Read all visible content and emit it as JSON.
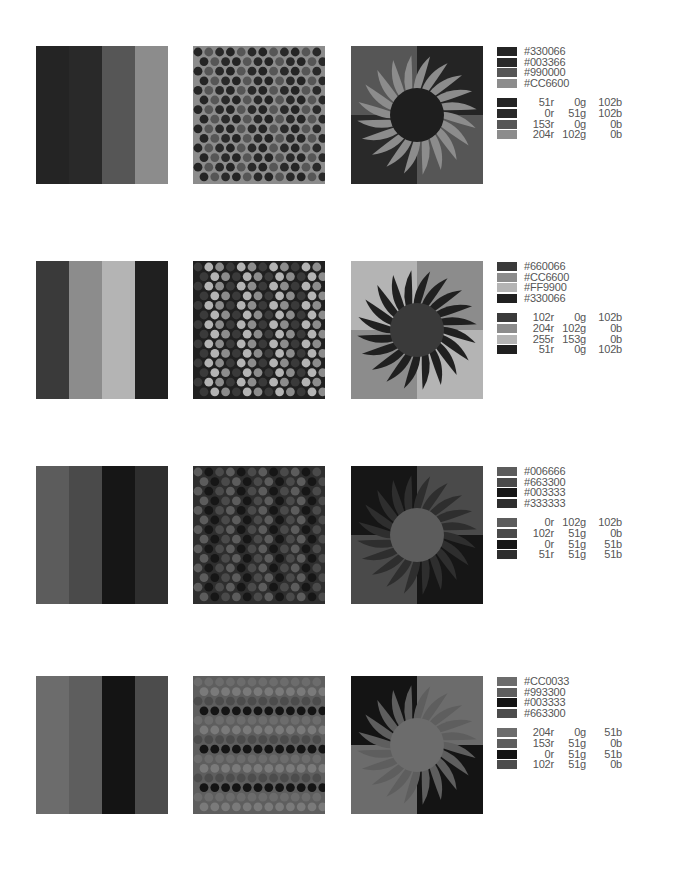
{
  "palettes": [
    {
      "id": "palette-1",
      "stripes": [
        {
          "hex": "#330066",
          "gray": "#242424",
          "width": 33
        },
        {
          "hex": "#003366",
          "gray": "#292929",
          "width": 33
        },
        {
          "hex": "#990000",
          "gray": "#565656",
          "width": 33
        },
        {
          "hex": "#CC6600",
          "gray": "#8c8c8c",
          "width": 33
        }
      ],
      "dots": {
        "bg": "#8c8c8c",
        "colors": [
          "#242424",
          "#292929",
          "#565656"
        ]
      },
      "sun": {
        "quads": [
          "#565656",
          "#242424",
          "#292929",
          "#565656"
        ],
        "rays": "#8c8c8c",
        "disc": "#1e1e1e"
      },
      "hex_labels": [
        "#330066",
        "#003366",
        "#990000",
        "#CC6600"
      ],
      "rgb_labels": [
        {
          "r": "51r",
          "g": "0g",
          "b": "102b"
        },
        {
          "r": "0r",
          "g": "51g",
          "b": "102b"
        },
        {
          "r": "153r",
          "g": "0g",
          "b": "0b"
        },
        {
          "r": "204r",
          "g": "102g",
          "b": "0b"
        }
      ],
      "swatches": [
        "#242424",
        "#292929",
        "#565656",
        "#8c8c8c"
      ]
    },
    {
      "id": "palette-2",
      "stripes": [
        {
          "hex": "#660066",
          "gray": "#3a3a3a",
          "width": 33
        },
        {
          "hex": "#CC6600",
          "gray": "#8c8c8c",
          "width": 33
        },
        {
          "hex": "#FF9900",
          "gray": "#b4b4b4",
          "width": 33
        },
        {
          "hex": "#330066",
          "gray": "#202020",
          "width": 33
        }
      ],
      "dots": {
        "bg": "#202020",
        "colors": [
          "#3a3a3a",
          "#8c8c8c",
          "#b4b4b4"
        ]
      },
      "sun": {
        "quads": [
          "#b4b4b4",
          "#8c8c8c",
          "#8c8c8c",
          "#b4b4b4"
        ],
        "rays": "#202020",
        "disc": "#3a3a3a"
      },
      "hex_labels": [
        "#660066",
        "#CC6600",
        "#FF9900",
        "#330066"
      ],
      "rgb_labels": [
        {
          "r": "102r",
          "g": "0g",
          "b": "102b"
        },
        {
          "r": "204r",
          "g": "102g",
          "b": "0b"
        },
        {
          "r": "255r",
          "g": "153g",
          "b": "0b"
        },
        {
          "r": "51r",
          "g": "0g",
          "b": "102b"
        }
      ],
      "swatches": [
        "#3a3a3a",
        "#8c8c8c",
        "#b4b4b4",
        "#202020"
      ]
    },
    {
      "id": "palette-3",
      "stripes": [
        {
          "hex": "#006666",
          "gray": "#5c5c5c",
          "width": 33
        },
        {
          "hex": "#663300",
          "gray": "#4a4a4a",
          "width": 33
        },
        {
          "hex": "#003333",
          "gray": "#161616",
          "width": 33
        },
        {
          "hex": "#333333",
          "gray": "#2e2e2e",
          "width": 33
        }
      ],
      "dots": {
        "bg": "#2e2e2e",
        "colors": [
          "#5c5c5c",
          "#4a4a4a",
          "#161616"
        ]
      },
      "sun": {
        "quads": [
          "#161616",
          "#4a4a4a",
          "#4a4a4a",
          "#161616"
        ],
        "rays": "#2e2e2e",
        "disc": "#5c5c5c"
      },
      "hex_labels": [
        "#006666",
        "#663300",
        "#003333",
        "#333333"
      ],
      "rgb_labels": [
        {
          "r": "0r",
          "g": "102g",
          "b": "102b"
        },
        {
          "r": "102r",
          "g": "51g",
          "b": "0b"
        },
        {
          "r": "0r",
          "g": "51g",
          "b": "51b"
        },
        {
          "r": "51r",
          "g": "51g",
          "b": "51b"
        }
      ],
      "swatches": [
        "#5c5c5c",
        "#4a4a4a",
        "#161616",
        "#2e2e2e"
      ]
    },
    {
      "id": "palette-4",
      "stripes": [
        {
          "hex": "#CC0033",
          "gray": "#6c6c6c",
          "width": 33
        },
        {
          "hex": "#993300",
          "gray": "#5e5e5e",
          "width": 33
        },
        {
          "hex": "#003333",
          "gray": "#141414",
          "width": 33
        },
        {
          "hex": "#663300",
          "gray": "#4c4c4c",
          "width": 33
        }
      ],
      "dots": {
        "bg": "#5e5e5e",
        "colors": [
          "#6c6c6c",
          "#141414",
          "#4c4c4c",
          "#7a7a7a"
        ]
      },
      "sun": {
        "quads": [
          "#141414",
          "#6c6c6c",
          "#6c6c6c",
          "#141414"
        ],
        "rays": "#5e5e5e",
        "disc": "#6c6c6c"
      },
      "hex_labels": [
        "#CC0033",
        "#993300",
        "#003333",
        "#663300"
      ],
      "rgb_labels": [
        {
          "r": "204r",
          "g": "0g",
          "b": "51b"
        },
        {
          "r": "153r",
          "g": "51g",
          "b": "0b"
        },
        {
          "r": "0r",
          "g": "51g",
          "b": "51b"
        },
        {
          "r": "102r",
          "g": "51g",
          "b": "0b"
        }
      ],
      "swatches": [
        "#6c6c6c",
        "#5e5e5e",
        "#141414",
        "#4c4c4c"
      ]
    }
  ]
}
